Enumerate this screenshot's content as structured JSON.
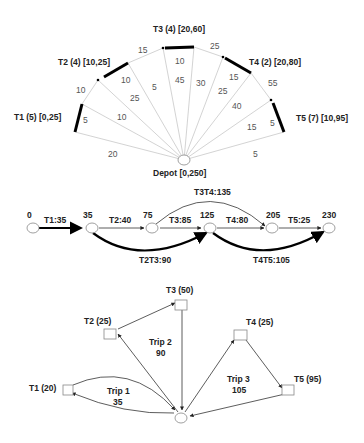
{
  "fan": {
    "depot_label": "Depot [0,250]",
    "tasks": [
      {
        "id": "T1",
        "label": "T1 (5) [0,25]",
        "service": "5"
      },
      {
        "id": "T2",
        "label": "T2 (4) [10,25]",
        "service": "10"
      },
      {
        "id": "T3",
        "label": "T3 (4) [20,60]",
        "service": "10"
      },
      {
        "id": "T4",
        "label": "T4 (2) [20,80]",
        "service": "15"
      },
      {
        "id": "T5",
        "label": "T5 (7) [10,95]",
        "service": "5"
      }
    ],
    "arc_travel": [
      "10",
      "15",
      "25",
      "55"
    ],
    "depot_to_start": [
      "20",
      "25",
      "45",
      "25",
      "15"
    ],
    "end_to_depot": [
      "10",
      "5",
      "30",
      "40",
      "5"
    ]
  },
  "timeline": {
    "nodes": [
      "0",
      "35",
      "75",
      "125",
      "205",
      "230"
    ],
    "arcs": [
      {
        "label": "T1:35",
        "bold": true
      },
      {
        "label": "T2:40",
        "bold": false
      },
      {
        "label": "T3:85",
        "bold": false
      },
      {
        "label": "T4:80",
        "bold": false
      },
      {
        "label": "T5:25",
        "bold": false
      }
    ],
    "curved_arcs": [
      {
        "label": "T3T4:135",
        "bold": false
      },
      {
        "label": "T2T3:90",
        "bold": true
      },
      {
        "label": "T4T5:105",
        "bold": true
      }
    ]
  },
  "routes": {
    "tasks": [
      {
        "label": "T1 (20)"
      },
      {
        "label": "T2 (25)"
      },
      {
        "label": "T3 (50)"
      },
      {
        "label": "T4 (25)"
      },
      {
        "label": "T5 (95)"
      }
    ],
    "trips": [
      {
        "name": "Trip 1",
        "cost": "35"
      },
      {
        "name": "Trip 2",
        "cost": "90"
      },
      {
        "name": "Trip 3",
        "cost": "105"
      }
    ]
  }
}
